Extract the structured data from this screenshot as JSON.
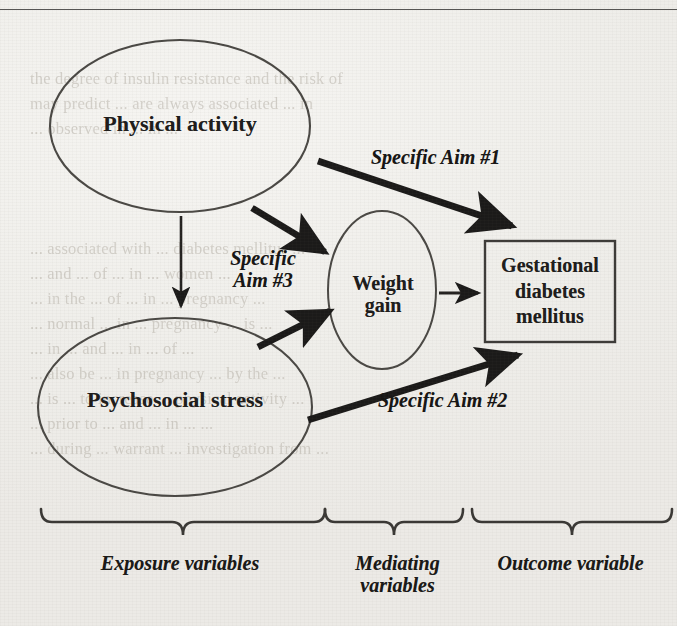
{
  "page": {
    "background_color": "#f3f2ef",
    "ink_color": "#1d1c1b",
    "rule_color": "#3b3a38",
    "ghost_text_color": "#b9b4ab",
    "ghost_top": "the degree of insulin resistance and the risk of\nmay predict ... are always associated ... in\n... observed in ... in ...",
    "ghost_mid": "... associated with ... diabetes mellitus ...\n... and ... of ... in ... women ...\n... in the ... of ... in ... pregnancy ...\n... normal ... in ... pregnancy ... is ...\n... in ... and ... in ... of ...\n... also be ... in pregnancy ... by the ...\n... is ... to increase ... physical activity ...\n... prior to ... and ... in ... ...\n... during ... warrant ... investigation from ...",
    "ghost_bottom": ""
  },
  "diagram": {
    "type": "conceptual-path-diagram",
    "nodes": [
      {
        "id": "physical-activity",
        "label": "Physical activity",
        "shape": "ellipse",
        "group": "Exposure variables"
      },
      {
        "id": "psychosocial-stress",
        "label": "Psychosocial stress",
        "shape": "ellipse",
        "group": "Exposure variables"
      },
      {
        "id": "weight-gain",
        "label": "Weight\ngain",
        "shape": "ellipse",
        "group": "Mediating variables"
      },
      {
        "id": "gestational-diabetes",
        "label": "Gestational\ndiabetes\nmellitus",
        "shape": "rectangle",
        "group": "Outcome variable"
      }
    ],
    "edges": [
      {
        "id": "aim1",
        "from": "physical-activity",
        "to": "gestational-diabetes",
        "label": "Specific Aim #1",
        "thick": true
      },
      {
        "id": "aim2",
        "from": "psychosocial-stress",
        "to": "gestational-diabetes",
        "label": "Specific Aim #2",
        "thick": true
      },
      {
        "id": "aim3a",
        "from": "physical-activity",
        "to": "weight-gain",
        "label": "Specific\nAim #3",
        "thick": true
      },
      {
        "id": "aim3b",
        "from": "psychosocial-stress",
        "to": "weight-gain",
        "label": "",
        "thick": true
      },
      {
        "id": "pa-ps",
        "from": "physical-activity",
        "to": "psychosocial-stress",
        "label": "",
        "thick": false
      },
      {
        "id": "wg-gdm",
        "from": "weight-gain",
        "to": "gestational-diabetes",
        "label": "",
        "thick": false
      }
    ],
    "aim_labels": {
      "aim1": "Specific Aim #1",
      "aim2": "Specific Aim #2",
      "aim3": "Specific\nAim #3"
    },
    "brace_groups": [
      {
        "id": "exposure",
        "label": "Exposure variables"
      },
      {
        "id": "mediating",
        "label": "Mediating\nvariables"
      },
      {
        "id": "outcome",
        "label": "Outcome variable"
      }
    ]
  }
}
